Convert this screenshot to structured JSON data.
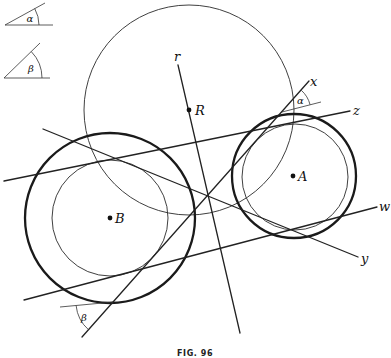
{
  "figure": {
    "caption": "FIG. 96",
    "colors": {
      "ink": "#222222",
      "background": "#ffffff"
    },
    "given_angles": {
      "alpha": {
        "symbol": "α"
      },
      "beta": {
        "symbol": "β"
      }
    },
    "points": {
      "R": {
        "label": "R"
      },
      "A": {
        "label": "A"
      },
      "B": {
        "label": "B"
      }
    },
    "lines": {
      "r": {
        "label": "r"
      },
      "x": {
        "label": "x"
      },
      "y": {
        "label": "y"
      },
      "z": {
        "label": "z"
      },
      "w": {
        "label": "w"
      }
    },
    "angle_marks": {
      "alpha": {
        "symbol": "α",
        "between": [
          "x",
          "reference line parallel to w"
        ]
      },
      "beta": {
        "symbol": "β",
        "between": [
          "x",
          "reference line"
        ]
      }
    },
    "circles": [
      {
        "center": "R",
        "style": "thin",
        "description": "large circle centered at R"
      },
      {
        "center": "A",
        "style": "thick"
      },
      {
        "center": "A",
        "style": "thin"
      },
      {
        "center": "B",
        "style": "thick"
      },
      {
        "center": "B",
        "style": "thin"
      }
    ]
  }
}
